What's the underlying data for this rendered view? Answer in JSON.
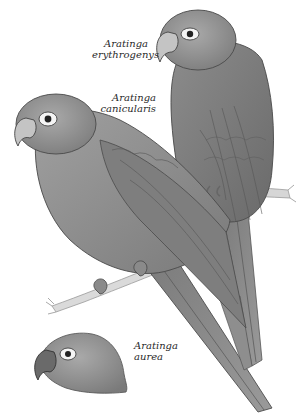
{
  "illustration": {
    "style": "grayscale natural-history plate",
    "colors": {
      "background": "#ffffff",
      "plumage_dark": "#6e6e6e",
      "plumage_mid": "#8a8a8a",
      "plumage_light": "#a8a8a8",
      "beak": "#c9c9c9",
      "branch": "#d4d4d4",
      "text": "#2a2a2a"
    },
    "birds": [
      {
        "id": "erythrogenys",
        "label_line1": "Aratinga",
        "label_line2": "erythrogenys",
        "pose": "perched on branch, upper right, facing left"
      },
      {
        "id": "canicularis",
        "label_line1": "Aratinga",
        "label_line2": "canicularis",
        "pose": "perched on twig, left, facing left"
      },
      {
        "id": "aurea",
        "label_line1": "Aratinga",
        "label_line2": "aurea",
        "pose": "head only, bottom left"
      }
    ]
  }
}
